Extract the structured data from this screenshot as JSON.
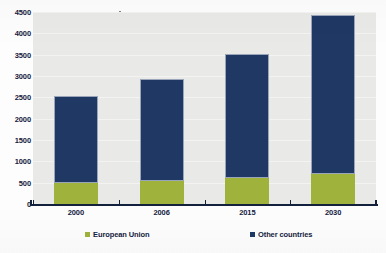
{
  "chart_data": {
    "type": "bar",
    "stacked": true,
    "title": "",
    "xlabel": "",
    "ylabel": "",
    "categories": [
      "2000",
      "2006",
      "2015",
      "2030"
    ],
    "series": [
      {
        "name": "European Union",
        "color": "#9fb23c",
        "values": [
          490,
          550,
          620,
          700
        ]
      },
      {
        "name": "Other countries",
        "color": "#1f3864",
        "values": [
          2050,
          2370,
          2900,
          3740
        ]
      }
    ],
    "totals": [
      2540,
      2920,
      3520,
      4440
    ],
    "ylim": [
      0,
      4500
    ],
    "yticks": [
      0,
      500,
      1000,
      1500,
      2000,
      2500,
      3000,
      3500,
      4000,
      4500
    ],
    "ytick_labels": [
      "0",
      "500",
      "1000",
      "1500",
      "2000",
      "2500",
      "3000",
      "3500",
      "4000",
      "4500"
    ],
    "grid": true,
    "legend_position": "bottom"
  },
  "legend": {
    "items": [
      {
        "label": "European Union",
        "color": "#9fb23c"
      },
      {
        "label": "Other countries",
        "color": "#1f3864"
      }
    ]
  },
  "axes": {
    "y_tick_labels": [
      "4500",
      "4000",
      "3500",
      "3000",
      "2500",
      "2000",
      "1500",
      "1000",
      "500",
      "0"
    ],
    "x_tick_labels": [
      "2000",
      "2006",
      "2015",
      "2030"
    ]
  },
  "colors": {
    "european_union": "#9fb23c",
    "other_countries": "#1f3864",
    "plot_background": "#e9e9e7",
    "axis": "#14213d",
    "page_background": "#fdfdfd"
  }
}
